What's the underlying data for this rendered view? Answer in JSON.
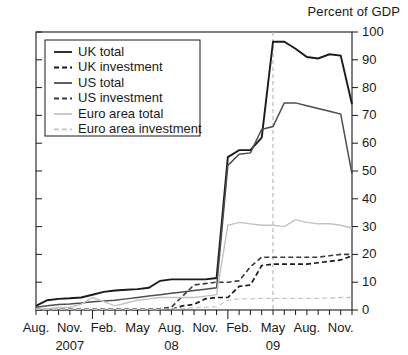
{
  "chart_data": {
    "type": "line",
    "title": "",
    "unit_label": "Percent of GDP",
    "xlabel": "",
    "ylabel": "",
    "ylim": [
      0,
      100
    ],
    "ytick_values": [
      0,
      10,
      20,
      30,
      40,
      50,
      60,
      70,
      80,
      90,
      100
    ],
    "ytick_labels": [
      "0",
      "10",
      "20",
      "30",
      "40",
      "50",
      "60",
      "70",
      "80",
      "90",
      "100"
    ],
    "y_axis_position": "right",
    "grid": false,
    "legend_position": "upper-left",
    "x": [
      "2007-08",
      "2007-09",
      "2007-10",
      "2007-11",
      "2007-12",
      "2008-01",
      "2008-02",
      "2008-03",
      "2008-04",
      "2008-05",
      "2008-06",
      "2008-07",
      "2008-08",
      "2008-09",
      "2008-10",
      "2008-11",
      "2008-12",
      "2009-01",
      "2009-02",
      "2009-03",
      "2009-04",
      "2009-05",
      "2009-06",
      "2009-07",
      "2009-08",
      "2009-09",
      "2009-10",
      "2009-11",
      "2009-12"
    ],
    "xtick_labels": [
      "Aug.",
      "Nov.",
      "Feb.",
      "May",
      "Aug.",
      "Nov.",
      "Feb.",
      "May",
      "Aug.",
      "Nov."
    ],
    "xtick_positions": [
      "2007-08",
      "2007-11",
      "2008-02",
      "2008-05",
      "2008-08",
      "2008-11",
      "2009-02",
      "2009-05",
      "2009-08",
      "2009-11"
    ],
    "year_labels": [
      {
        "text": "2007",
        "at": "2007-11"
      },
      {
        "text": "08",
        "at": "2008-08"
      },
      {
        "text": "09",
        "at": "2009-05"
      }
    ],
    "annotations": [
      {
        "type": "vertical-dashed-line",
        "at": "2009-05",
        "color": "#b9b9b9"
      }
    ],
    "series": [
      {
        "name": "UK total",
        "style": "solid",
        "color": "#1a1a1a",
        "width": 1.9,
        "values": [
          1.5,
          3.5,
          4.0,
          4.2,
          4.5,
          5.5,
          6.5,
          7.0,
          7.3,
          7.5,
          8.0,
          10.5,
          11.0,
          11.0,
          11.0,
          11.0,
          11.5,
          55.0,
          57.5,
          57.5,
          62.0,
          96.5,
          96.5,
          94.0,
          91.0,
          90.5,
          92.0,
          91.5,
          74.0
        ]
      },
      {
        "name": "UK investment",
        "style": "dashed",
        "color": "#1a1a1a",
        "width": 1.7,
        "values": [
          0.2,
          0.2,
          0.2,
          0.2,
          0.2,
          0.2,
          0.2,
          0.2,
          0.2,
          0.2,
          0.2,
          0.2,
          0.2,
          1.5,
          2.0,
          4.0,
          4.5,
          4.5,
          8.5,
          9.0,
          16.0,
          16.5,
          16.5,
          16.5,
          16.5,
          17.0,
          17.5,
          18.0,
          19.5
        ]
      },
      {
        "name": "US total",
        "style": "solid",
        "color": "#4d4d4d",
        "width": 1.5,
        "values": [
          1.0,
          1.5,
          2.0,
          2.2,
          2.5,
          3.0,
          3.2,
          3.5,
          4.0,
          4.5,
          5.0,
          5.5,
          6.0,
          6.5,
          7.0,
          7.5,
          8.0,
          52.0,
          56.0,
          56.5,
          65.0,
          66.0,
          74.5,
          74.5,
          73.5,
          72.5,
          71.5,
          70.5,
          49.0
        ]
      },
      {
        "name": "US investment",
        "style": "dashed",
        "color": "#3a3a3a",
        "width": 1.6,
        "values": [
          0.2,
          0.2,
          0.2,
          0.2,
          0.2,
          0.2,
          0.2,
          0.2,
          0.2,
          0.2,
          0.2,
          0.5,
          1.0,
          5.0,
          9.0,
          9.5,
          10.0,
          10.0,
          10.5,
          15.5,
          19.0,
          19.0,
          19.0,
          19.0,
          19.0,
          19.0,
          19.5,
          20.0,
          20.0
        ]
      },
      {
        "name": "Euro area total",
        "style": "solid",
        "color": "#c2c2c2",
        "width": 1.4,
        "values": [
          0.3,
          0.5,
          0.8,
          1.0,
          2.0,
          4.5,
          3.0,
          1.5,
          2.5,
          3.5,
          4.0,
          4.5,
          4.5,
          4.5,
          4.5,
          5.0,
          5.5,
          30.5,
          31.5,
          31.0,
          30.5,
          30.5,
          30.0,
          32.5,
          31.5,
          31.0,
          31.0,
          30.5,
          29.5
        ]
      },
      {
        "name": "Euro area investment",
        "style": "dashed",
        "color": "#c8c8c8",
        "width": 1.3,
        "values": [
          0.2,
          0.2,
          0.2,
          0.2,
          0.2,
          0.2,
          0.2,
          0.2,
          0.2,
          0.2,
          0.2,
          0.3,
          0.4,
          0.5,
          0.8,
          1.0,
          1.2,
          3.5,
          4.0,
          4.0,
          4.2,
          4.2,
          4.2,
          4.2,
          4.2,
          4.2,
          4.3,
          4.5,
          4.5
        ]
      }
    ],
    "legend_entries": [
      {
        "label": "UK total",
        "style": "solid",
        "color": "#1a1a1a"
      },
      {
        "label": "UK investment",
        "style": "dashed",
        "color": "#1a1a1a"
      },
      {
        "label": "US total",
        "style": "solid",
        "color": "#4d4d4d"
      },
      {
        "label": "US investment",
        "style": "dashed",
        "color": "#3a3a3a"
      },
      {
        "label": "Euro area total",
        "style": "solid",
        "color": "#c2c2c2"
      },
      {
        "label": "Euro area investment",
        "style": "dashed",
        "color": "#c8c8c8"
      }
    ]
  }
}
